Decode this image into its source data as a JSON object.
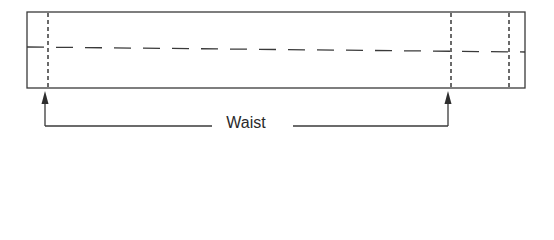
{
  "diagram": {
    "type": "garment-pattern-waistband",
    "label": "Waist",
    "colors": {
      "line": "#3a3a3a",
      "background": "#ffffff"
    },
    "rectangle": {
      "x": 27,
      "y": 12,
      "width": 498,
      "height": 76
    },
    "fold_line": {
      "x1": 27,
      "y1": 47,
      "x2": 525,
      "y2": 52,
      "style": "dashed"
    },
    "vertical_marks": [
      {
        "x": 48,
        "style": "dotted"
      },
      {
        "x": 451,
        "style": "dotted"
      },
      {
        "x": 509,
        "style": "dotted"
      }
    ],
    "arrows": [
      {
        "x": 45,
        "from_y": 126,
        "to_y": 91
      },
      {
        "x": 448,
        "from_y": 126,
        "to_y": 91
      }
    ],
    "bracket_y": 126
  }
}
